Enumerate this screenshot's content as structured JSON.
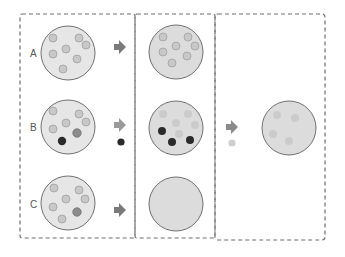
{
  "diagram": {
    "colors": {
      "dash": "#6e6e6e",
      "circle_fill": "#e6e6e6",
      "circle_fill_mid": "#d9d9d9",
      "circle_stroke": "#707070",
      "particle_light": "#c8c8c8",
      "particle_light_stroke": "#a0a0a0",
      "particle_medium": "#8c8c8c",
      "particle_dark": "#2a2a2a",
      "particle_faint": "#c9c9c9",
      "arrow": "#7a7a7a"
    },
    "rows": [
      {
        "label": "A"
      },
      {
        "label": "B"
      },
      {
        "label": "C"
      }
    ],
    "stages": [
      {
        "name": "initial-samples"
      },
      {
        "name": "after-treatment"
      },
      {
        "name": "final-result"
      }
    ]
  }
}
